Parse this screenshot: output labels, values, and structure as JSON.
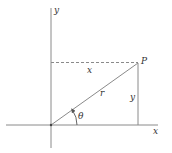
{
  "diagram": {
    "type": "polar-cartesian-coordinates",
    "colors": {
      "line": "#8a8a8a",
      "text": "#333333",
      "background": "#ffffff"
    },
    "axes": {
      "x_label": "x",
      "y_label": "y"
    },
    "point": {
      "label": "P"
    },
    "segments": {
      "horizontal_dashed_label": "x",
      "vertical_label": "y",
      "radius_label": "r"
    },
    "angle": {
      "label": "θ"
    }
  }
}
